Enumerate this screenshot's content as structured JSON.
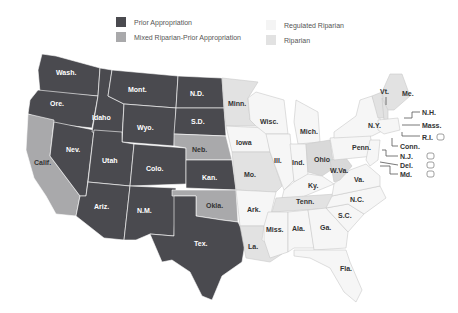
{
  "legend": {
    "items": [
      {
        "label": "Prior Appropriation",
        "color": "#4a4a4f"
      },
      {
        "label": "Mixed Riparian-Prior Appropriation",
        "color": "#a9a9ab"
      },
      {
        "label": "Regulated Riparian",
        "color": "#f6f6f6"
      },
      {
        "label": "Riparian",
        "color": "#e2e2e2"
      }
    ]
  },
  "map": {
    "states": {
      "wash": "Wash.",
      "ore": "Ore.",
      "calif": "Calif.",
      "idaho": "Idaho",
      "nev": "Nev.",
      "mont": "Mont.",
      "wyo": "Wyo.",
      "utah": "Utah",
      "ariz": "Ariz.",
      "colo": "Colo.",
      "nm": "N.M.",
      "nd": "N.D.",
      "sd": "S.D.",
      "neb": "Neb.",
      "kan": "Kan.",
      "okla": "Okla.",
      "tex": "Tex.",
      "minn": "Minn.",
      "iowa": "Iowa",
      "mo": "Mo.",
      "ark": "Ark.",
      "la": "La.",
      "wisc": "Wisc.",
      "ill": "Ill.",
      "mich": "Mich.",
      "ind": "Ind.",
      "ohio": "Ohio",
      "ky": "Ky.",
      "tenn": "Tenn.",
      "miss": "Miss.",
      "ala": "Ala.",
      "ga": "Ga.",
      "fla": "Fla.",
      "sc": "S.C.",
      "nc": "N.C.",
      "va": "Va.",
      "wva": "W.Va.",
      "penn": "Penn.",
      "ny": "N.Y.",
      "vt": "Vt.",
      "me": "Me.",
      "nh": "N.H.",
      "mass": "Mass.",
      "ri": "R.I.",
      "conn": "Conn.",
      "nj": "N.J.",
      "del": "Del.",
      "md": "Md."
    }
  }
}
